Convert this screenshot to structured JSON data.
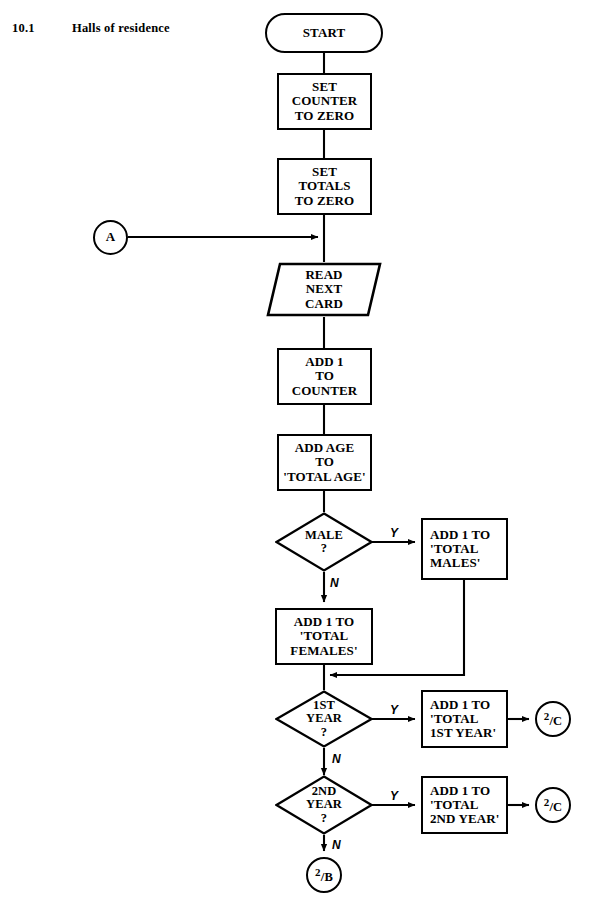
{
  "section": {
    "number": "10.1",
    "title": "Halls of residence"
  },
  "flowchart": {
    "title": "Halls of residence flowchart",
    "nodes": {
      "start": {
        "type": "terminator",
        "label": "START"
      },
      "set_counter": {
        "type": "process",
        "lines": [
          "SET",
          "COUNTER",
          "TO ZERO"
        ]
      },
      "set_totals": {
        "type": "process",
        "lines": [
          "SET",
          "TOTALS",
          "TO ZERO"
        ]
      },
      "connector_a": {
        "type": "connector",
        "label": "A"
      },
      "read_card": {
        "type": "io",
        "lines": [
          "READ",
          "NEXT",
          "CARD"
        ]
      },
      "add_counter": {
        "type": "process",
        "lines": [
          "ADD 1",
          "TO",
          "COUNTER"
        ]
      },
      "add_age": {
        "type": "process",
        "lines": [
          "ADD AGE",
          "TO",
          "'TOTAL AGE'"
        ]
      },
      "male_decision": {
        "type": "decision",
        "lines": [
          "MALE",
          "?"
        ]
      },
      "total_males": {
        "type": "process",
        "lines": [
          "ADD 1 TO",
          "'TOTAL",
          "MALES'"
        ]
      },
      "total_females": {
        "type": "process",
        "lines": [
          "ADD 1 TO",
          "'TOTAL",
          "FEMALES'"
        ]
      },
      "first_year_decision": {
        "type": "decision",
        "lines": [
          "1ST",
          "YEAR",
          "?"
        ]
      },
      "total_first_year": {
        "type": "process",
        "lines": [
          "ADD 1 TO",
          "'TOTAL",
          "1ST YEAR'"
        ]
      },
      "connector_c1": {
        "type": "connector",
        "numerator": "2",
        "slash": "/",
        "denominator": "C"
      },
      "second_year_decision": {
        "type": "decision",
        "lines": [
          "2ND",
          "YEAR",
          "?"
        ]
      },
      "total_second_year": {
        "type": "process",
        "lines": [
          "ADD 1 TO",
          "'TOTAL",
          "2ND YEAR'"
        ]
      },
      "connector_c2": {
        "type": "connector",
        "numerator": "2",
        "slash": "/",
        "denominator": "C"
      },
      "connector_b": {
        "type": "connector",
        "numerator": "2",
        "slash": "/",
        "denominator": "B"
      }
    },
    "branch_labels": {
      "male_yes": "Y",
      "male_no": "N",
      "first_year_yes": "Y",
      "first_year_no": "N",
      "second_year_yes": "Y",
      "second_year_no": "N"
    },
    "colors": {
      "stroke": "#000000",
      "fill": "#ffffff",
      "text": "#000000"
    }
  }
}
